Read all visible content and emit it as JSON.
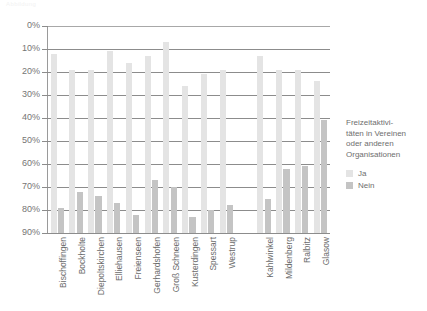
{
  "top_heading": "Abbildung",
  "chart_data": {
    "type": "bar",
    "title": "",
    "subtitle": "",
    "xlabel": "",
    "ylabel": "",
    "orientation": "vertical",
    "y_axis_inverted": true,
    "ylim": [
      0,
      90
    ],
    "grid": true,
    "gridlines": true,
    "legend_position": "right",
    "tick_labels": [
      "0%",
      "10%",
      "20%",
      "30%",
      "40%",
      "50%",
      "60%",
      "70%",
      "80%",
      "90%"
    ],
    "tick_values": [
      0,
      10,
      20,
      30,
      40,
      50,
      60,
      70,
      80,
      90
    ],
    "categories": [
      "Bischoffingen",
      "Bockholte",
      "Diepoltskirchen",
      "Elliehausen",
      "Freienseen",
      "Gerhardshofen",
      "Groß Schneen",
      "Kusterdingen",
      "Spessart",
      "Westrup",
      "",
      "Kahlwinkel",
      "Mildenberg",
      "Ralbitz",
      "Glasow"
    ],
    "series": [
      {
        "name": "Ja",
        "color": "#e4e4e4",
        "values": [
          12,
          19,
          19,
          11,
          16,
          13,
          7,
          26,
          21,
          19,
          null,
          13,
          19,
          19,
          24
        ]
      },
      {
        "name": "Nein",
        "color": "#c4c4c4",
        "values": [
          79,
          72,
          74,
          77,
          82,
          67,
          70,
          83,
          80,
          78,
          null,
          75,
          62,
          61,
          41
        ]
      }
    ]
  },
  "legend": {
    "title": "Freizeitaktivi-\ntäten in Vereinen\noder anderen\nOrganisationen",
    "title_lines": [
      "Freizeitaktivi-",
      "täten in Vereinen",
      "oder anderen",
      "Organisationen"
    ],
    "entries": [
      {
        "label": "Ja",
        "color": "#e4e4e4"
      },
      {
        "label": "Nein",
        "color": "#c4c4c4"
      }
    ]
  },
  "colors": {
    "ja": "#e4e4e4",
    "nein": "#c4c4c4",
    "grid": "#8c8c8c",
    "axis": "#9a9a9a",
    "text": "#6e6e6e",
    "background": "#ffffff"
  }
}
